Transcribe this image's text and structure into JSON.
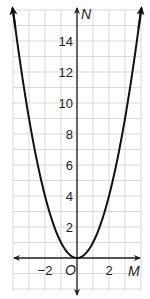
{
  "chart_data": {
    "type": "line",
    "title": "",
    "xlabel": "M",
    "ylabel": "N",
    "origin_label": "O",
    "function": "N = M^2",
    "xlim": [
      -4,
      4
    ],
    "ylim": [
      -2,
      16
    ],
    "grid": true,
    "grid_step_x": 1,
    "grid_step_y": 1,
    "x_ticks": [
      {
        "value": -2,
        "label": "−2"
      },
      {
        "value": 2,
        "label": "2"
      }
    ],
    "y_ticks": [
      {
        "value": 2,
        "label": "2"
      },
      {
        "value": 4,
        "label": "4"
      },
      {
        "value": 6,
        "label": "6"
      },
      {
        "value": 8,
        "label": "8"
      },
      {
        "value": 10,
        "label": "10"
      },
      {
        "value": 12,
        "label": "12"
      },
      {
        "value": 14,
        "label": "14"
      }
    ],
    "series": [
      {
        "name": "N = M²",
        "x": [
          -4,
          -3.5,
          -3,
          -2.5,
          -2,
          -1.5,
          -1,
          -0.5,
          0,
          0.5,
          1,
          1.5,
          2,
          2.5,
          3,
          3.5,
          4
        ],
        "y": [
          16,
          12.25,
          9,
          6.25,
          4,
          2.25,
          1,
          0.25,
          0,
          0.25,
          1,
          2.25,
          4,
          6.25,
          9,
          12.25,
          16
        ],
        "arrows_at_ends": true
      }
    ],
    "legend": null
  },
  "colors": {
    "grid": "#d9d9d9",
    "axis": "#231f20",
    "curve": "#111111",
    "background": "#ffffff"
  }
}
